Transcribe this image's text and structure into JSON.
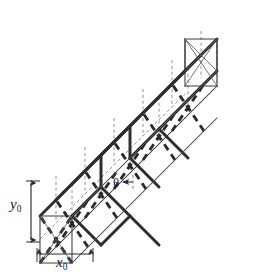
{
  "figure": {
    "kind": "engineering-line-diagram",
    "projection": "isometric",
    "background_color": "#ffffff",
    "line_color": "#3a3a3a",
    "heavy_line_color": "#2b2b2b",
    "hidden_line_color": "#6e6e6e",
    "label_color": "#1a1a1a"
  },
  "labels": {
    "height": {
      "text": "y",
      "subscript": "0",
      "meaning": "cross-section height dimension",
      "orientation": "vertical"
    },
    "width": {
      "text": "x",
      "subscript": "0",
      "meaning": "cross-section width dimension",
      "orientation": "horizontal"
    },
    "angle": {
      "text": "θ",
      "meaning": "diagonal brace inclination angle"
    }
  },
  "dimension_lines": {
    "vertical": {
      "name": "y0-dimension",
      "arrowheads": "both-ends",
      "x": 31,
      "y_top": 181,
      "y_bottom": 242
    },
    "horizontal": {
      "name": "x0-dimension",
      "arrowheads": "both-ends",
      "y": 254,
      "x_left": 37,
      "x_right": 93
    }
  },
  "geometry": {
    "bays": 5,
    "cross_section": "square",
    "members": [
      "chords",
      "verticals",
      "diagonal-braces",
      "cross-bracing"
    ],
    "line_styles": {
      "visible_outline": "thin solid",
      "visible_brace": "thick solid",
      "hidden_outline": "thin dashed",
      "hidden_brace": "thick dashed"
    }
  }
}
